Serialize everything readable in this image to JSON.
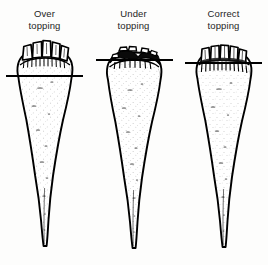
{
  "figure": {
    "background_color": "#fdfdfc",
    "ink_color": "#000000",
    "width": 268,
    "height": 265
  },
  "panels": [
    {
      "id": "over-topping",
      "caption_line1": "Over",
      "caption_line2": "topping",
      "cut_line_label": "topping cut line",
      "cut_line_y": 38,
      "crown_label": "beet crown",
      "stubs_label": "leaf petiole stubs",
      "root_label": "beet root body",
      "tail_label": "tapered root tail"
    },
    {
      "id": "under-topping",
      "caption_line1": "Under",
      "caption_line2": "topping",
      "cut_line_label": "topping cut line",
      "cut_line_y": 22,
      "crown_label": "beet crown",
      "stubs_label": "leaf petiole stubs",
      "root_label": "beet root body",
      "tail_label": "tapered root tail"
    },
    {
      "id": "correct-topping",
      "caption_line1": "Correct",
      "caption_line2": "topping",
      "cut_line_label": "topping cut line",
      "cut_line_y": 25,
      "crown_label": "beet crown",
      "stubs_label": "leaf petiole stubs",
      "root_label": "beet root body",
      "tail_label": "tapered root tail"
    }
  ]
}
